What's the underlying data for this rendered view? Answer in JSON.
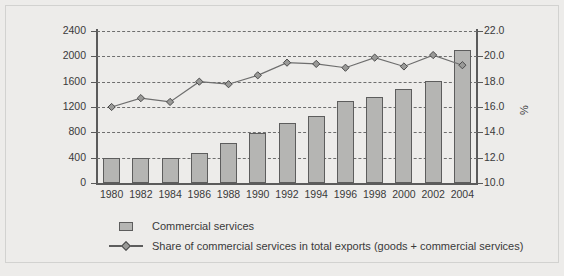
{
  "chart_data": {
    "type": "bar",
    "title": "",
    "subtitle": "",
    "xlabel": "",
    "ylabel": "US$ billion",
    "y2label": "%",
    "grid": true,
    "legend_position": "bottom-left",
    "categories": [
      "1980",
      "1982",
      "1984",
      "1986",
      "1988",
      "1990",
      "1992",
      "1994",
      "1996",
      "1998",
      "2000",
      "2002",
      "2004"
    ],
    "ylim": [
      0,
      2400
    ],
    "yticks": [
      "0",
      "400",
      "800",
      "1200",
      "1600",
      "2000",
      "2400"
    ],
    "y2lim": [
      10.0,
      22.0
    ],
    "y2ticks": [
      "10.0",
      "12.0",
      "14.0",
      "16.0",
      "18.0",
      "20.0",
      "22.0"
    ],
    "series": [
      {
        "name": "Commercial services",
        "type": "bar",
        "axis": "left",
        "unit": "US$ billion",
        "color": "#b5b5b3",
        "values": [
          400,
          395,
          400,
          480,
          625,
          790,
          940,
          1055,
          1290,
          1360,
          1480,
          1605,
          2105
        ]
      },
      {
        "name": "Share of commercial services in total exports (goods + commercial services)",
        "type": "line",
        "axis": "right",
        "unit": "%",
        "color": "#6e6e6e",
        "values": [
          16.0,
          16.7,
          16.4,
          18.0,
          17.8,
          18.5,
          19.5,
          19.4,
          19.1,
          19.9,
          19.2,
          20.1,
          19.3
        ]
      }
    ]
  },
  "legend": {
    "items": [
      {
        "label": "Commercial services",
        "key": "bar-swatch"
      },
      {
        "label": "Share of commercial services in total exports (goods + commercial services)",
        "key": "line-marker"
      }
    ]
  }
}
